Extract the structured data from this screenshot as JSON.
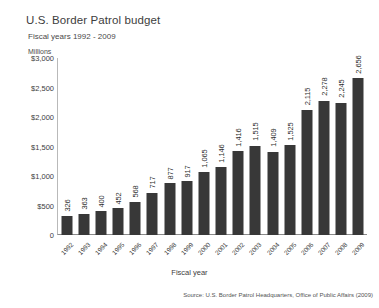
{
  "chart_data": {
    "type": "bar",
    "title": "U.S. Border Patrol budget",
    "subtitle": "Fiscal years 1992 - 2009",
    "units_label": "Millions",
    "xlabel": "Fiscal year",
    "ylabel": "",
    "ylim": [
      0,
      3000
    ],
    "ytick_values": [
      0,
      500,
      1000,
      1500,
      2000,
      2500,
      3000
    ],
    "ytick_labels": [
      "0",
      "$500",
      "$1,000",
      "$1,500",
      "$2,000",
      "$2,500",
      "$3,000"
    ],
    "grid": false,
    "legend": "none",
    "bar_color": "#383838",
    "categories": [
      "1992",
      "1993",
      "1994",
      "1995",
      "1996",
      "1997",
      "1998",
      "1999",
      "2000",
      "2001",
      "2002",
      "2003",
      "2004",
      "2005",
      "2006",
      "2007",
      "2008",
      "2009"
    ],
    "values": [
      326,
      363,
      400,
      452,
      568,
      717,
      877,
      917,
      1065,
      1146,
      1416,
      1515,
      1409,
      1525,
      2115,
      2278,
      2245,
      2656
    ],
    "value_labels": [
      "326",
      "363",
      "400",
      "452",
      "568",
      "717",
      "877",
      "917",
      "1,065",
      "1,146",
      "1,416",
      "1,515",
      "1,409",
      "1,525",
      "2,115",
      "2,278",
      "2,245",
      "2,656"
    ],
    "source": "Source: U.S. Border Patrol Headquarters, Office of Public Affairs (2009)"
  }
}
